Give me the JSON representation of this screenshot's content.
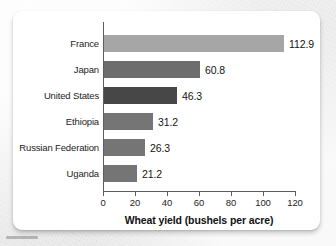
{
  "chart_data": {
    "type": "bar",
    "orientation": "horizontal",
    "title": "",
    "xlabel": "Wheat yield (bushels per acre)",
    "ylabel": "",
    "xlim": [
      0,
      120
    ],
    "xticks": [
      0,
      20,
      40,
      60,
      80,
      100,
      120
    ],
    "grid": false,
    "legend": null,
    "categories": [
      "France",
      "Japan",
      "United States",
      "Ethiopia",
      "Russian Federation",
      "Uganda"
    ],
    "values": [
      112.9,
      60.8,
      46.3,
      31.2,
      26.3,
      21.2
    ],
    "value_labels": [
      "112.9",
      "60.8",
      "46.3",
      "31.2",
      "26.3",
      "21.2"
    ],
    "bar_colors": [
      "#a6a6a6",
      "#6d6d6d",
      "#474747",
      "#757575",
      "#757575",
      "#757575"
    ],
    "bars": [
      {
        "category": "France",
        "value": 112.9,
        "label": "112.9",
        "color": "#a6a6a6"
      },
      {
        "category": "Japan",
        "value": 60.8,
        "label": "60.8",
        "color": "#6d6d6d"
      },
      {
        "category": "United States",
        "value": 46.3,
        "label": "46.3",
        "color": "#474747"
      },
      {
        "category": "Ethiopia",
        "value": 31.2,
        "label": "31.2",
        "color": "#757575"
      },
      {
        "category": "Russian Federation",
        "value": 26.3,
        "label": "26.3",
        "color": "#757575"
      },
      {
        "category": "Uganda",
        "value": 21.2,
        "label": "21.2",
        "color": "#757575"
      }
    ]
  },
  "axis": {
    "tick_labels": [
      "0",
      "20",
      "40",
      "60",
      "80",
      "100",
      "120"
    ],
    "title": "Wheat yield (bushels per acre)",
    "line_color": "#5d5d5d"
  },
  "colors": {
    "card_background": "#ffffff",
    "page_background": "#eeeeee",
    "text": "#1d1d1d",
    "axis": "#5d5d5d"
  }
}
